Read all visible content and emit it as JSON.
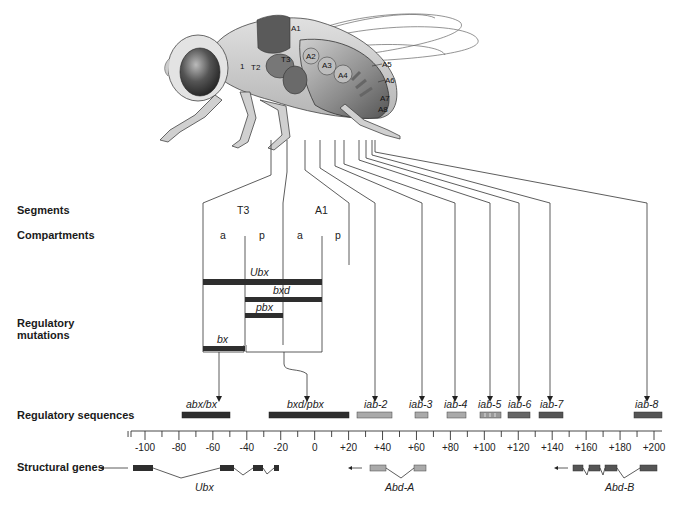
{
  "row_labels": {
    "segments": "Segments",
    "compartments": "Compartments",
    "regulatory_mutations_1": "Regulatory",
    "regulatory_mutations_2": "mutations",
    "regulatory_sequences": "Regulatory sequences",
    "structural_genes": "Structural genes"
  },
  "fly": {
    "labels": {
      "T2": "T2",
      "T3": "T3",
      "T1": "1",
      "A1": "A1",
      "A2": "A2",
      "A3": "A3",
      "A4": "A4",
      "A5": "A5",
      "A6": "A6",
      "A7": "A7",
      "A8": "A8"
    }
  },
  "segments": [
    {
      "label": "T3",
      "compartments": [
        "a",
        "p"
      ]
    },
    {
      "label": "A1",
      "compartments": [
        "a",
        "p"
      ]
    }
  ],
  "mutations": {
    "Ubx": "Ubx",
    "bxd": "bxd",
    "pbx": "pbx",
    "bx": "bx"
  },
  "regulatory_sequences": [
    {
      "name": "abx/bx",
      "start": -78,
      "end": -50,
      "color": "#333333"
    },
    {
      "name": "bxd/pbx",
      "start": -27,
      "end": 20,
      "color": "#333333"
    },
    {
      "name": "iab-2",
      "start": 22,
      "end": 42,
      "color": "#aaaaaa"
    },
    {
      "name": "iab-3",
      "start": 55,
      "end": 63,
      "color": "#aaaaaa"
    },
    {
      "name": "iab-4",
      "start": 74,
      "end": 85,
      "color": "#aaaaaa"
    },
    {
      "name": "iab-5",
      "start": 94,
      "end": 106,
      "color": "#999999"
    },
    {
      "name": "iab-6",
      "start": 111,
      "end": 124,
      "color": "#666666"
    },
    {
      "name": "iab-7",
      "start": 130,
      "end": 144,
      "color": "#555555"
    },
    {
      "name": "iab-8",
      "start": 186,
      "end": 199,
      "color": "#555555"
    }
  ],
  "ruler": {
    "min": -100,
    "max": 200,
    "labels": [
      "-100",
      "-80",
      "-60",
      "-40",
      "-20",
      "0",
      "+20",
      "+40",
      "+60",
      "+80",
      "+100",
      "+120",
      "+140",
      "+160",
      "+180",
      "+200"
    ]
  },
  "structural_genes": [
    {
      "name": "Ubx",
      "color": "#333333"
    },
    {
      "name": "Abd-A",
      "color": "#aaaaaa"
    },
    {
      "name": "Abd-B",
      "color": "#555555"
    }
  ],
  "colors": {
    "dark_bar": "#2e2e2e",
    "light_bar": "#aaaaaa",
    "mid_bar": "#5a5a5a",
    "line": "#333333"
  }
}
